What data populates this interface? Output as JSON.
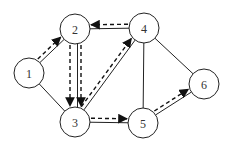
{
  "diagram": {
    "type": "directed-flow-network",
    "nodes": [
      {
        "id": "1",
        "label": "1"
      },
      {
        "id": "2",
        "label": "2"
      },
      {
        "id": "3",
        "label": "3"
      },
      {
        "id": "4",
        "label": "4"
      },
      {
        "id": "5",
        "label": "5"
      },
      {
        "id": "6",
        "label": "6"
      }
    ],
    "edges": [
      {
        "from": "1",
        "to": "2"
      },
      {
        "from": "1",
        "to": "3"
      },
      {
        "from": "2",
        "to": "3"
      },
      {
        "from": "2",
        "to": "4"
      },
      {
        "from": "3",
        "to": "4"
      },
      {
        "from": "3",
        "to": "5"
      },
      {
        "from": "4",
        "to": "5"
      },
      {
        "from": "4",
        "to": "6"
      },
      {
        "from": "5",
        "to": "6"
      }
    ],
    "dashed_arrows": [
      {
        "from": "1",
        "to": "2"
      },
      {
        "from": "2",
        "to": "3"
      },
      {
        "from": "2",
        "to": "3"
      },
      {
        "from": "4",
        "to": "2"
      },
      {
        "from": "3",
        "to": "4"
      },
      {
        "from": "3",
        "to": "5"
      },
      {
        "from": "5",
        "to": "6"
      }
    ]
  }
}
